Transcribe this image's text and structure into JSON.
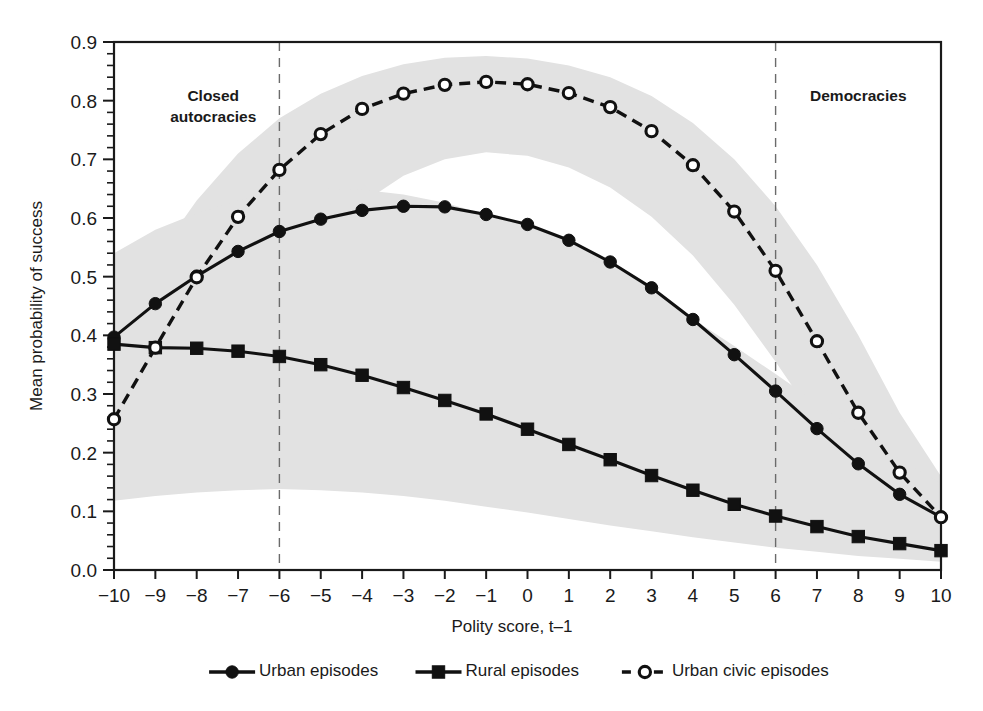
{
  "chart_data": {
    "type": "line",
    "title": "",
    "xlabel": "Polity score, t–1",
    "ylabel": "Mean probability of success",
    "xlim": [
      -10,
      10
    ],
    "ylim": [
      0.0,
      0.9
    ],
    "grid": false,
    "legend_position": "bottom",
    "x": [
      -10,
      -9,
      -8,
      -7,
      -6,
      -5,
      -4,
      -3,
      -2,
      -1,
      0,
      1,
      2,
      3,
      4,
      5,
      6,
      7,
      8,
      9,
      10
    ],
    "x_tick_labels": [
      "−10",
      "−9",
      "−8",
      "−7",
      "−6",
      "−5",
      "−4",
      "−3",
      "−2",
      "−1",
      "0",
      "1",
      "2",
      "3",
      "4",
      "5",
      "6",
      "7",
      "8",
      "9",
      "10"
    ],
    "y_tick_labels": [
      "0.0",
      "0.1",
      "0.2",
      "0.3",
      "0.4",
      "0.5",
      "0.6",
      "0.7",
      "0.8",
      "0.9"
    ],
    "y_tick_values": [
      0.0,
      0.1,
      0.2,
      0.3,
      0.4,
      0.5,
      0.6,
      0.7,
      0.8,
      0.9
    ],
    "y_minor_tick_step": 0.02,
    "series": [
      {
        "name": "Urban episodes",
        "marker": "filled-circle",
        "line_style": "solid",
        "color": "#111111",
        "values": [
          0.397,
          0.454,
          0.501,
          0.543,
          0.577,
          0.598,
          0.613,
          0.62,
          0.619,
          0.606,
          0.589,
          0.562,
          0.525,
          0.481,
          0.427,
          0.367,
          0.305,
          0.241,
          0.181,
          0.129,
          0.09
        ]
      },
      {
        "name": "Rural episodes",
        "marker": "filled-square",
        "line_style": "solid",
        "color": "#111111",
        "values": [
          0.385,
          0.379,
          0.378,
          0.373,
          0.364,
          0.35,
          0.332,
          0.311,
          0.289,
          0.266,
          0.24,
          0.214,
          0.188,
          0.161,
          0.136,
          0.112,
          0.092,
          0.074,
          0.057,
          0.045,
          0.033
        ]
      },
      {
        "name": "Urban civic episodes",
        "marker": "open-circle",
        "line_style": "dashed",
        "color": "#111111",
        "values": [
          0.257,
          0.379,
          0.499,
          0.602,
          0.682,
          0.743,
          0.786,
          0.812,
          0.827,
          0.832,
          0.828,
          0.813,
          0.789,
          0.748,
          0.69,
          0.611,
          0.51,
          0.39,
          0.268,
          0.166,
          0.09
        ]
      }
    ],
    "confidence_bands": [
      {
        "for_series": "Urban civic episodes",
        "color": "#e2e2e2",
        "lower": [
          0.12,
          0.19,
          0.28,
          0.38,
          0.48,
          0.56,
          0.625,
          0.672,
          0.7,
          0.712,
          0.706,
          0.686,
          0.652,
          0.602,
          0.536,
          0.452,
          0.355,
          0.252,
          0.158,
          0.086,
          0.036
        ],
        "upper": [
          0.42,
          0.53,
          0.63,
          0.71,
          0.77,
          0.812,
          0.842,
          0.862,
          0.873,
          0.876,
          0.872,
          0.86,
          0.84,
          0.808,
          0.762,
          0.7,
          0.62,
          0.52,
          0.4,
          0.268,
          0.16
        ]
      },
      {
        "for_series": "Urban episodes",
        "color": "#e2e2e2",
        "lower": [
          0.25,
          0.31,
          0.36,
          0.404,
          0.44,
          0.466,
          0.486,
          0.497,
          0.5,
          0.492,
          0.477,
          0.452,
          0.418,
          0.376,
          0.326,
          0.272,
          0.217,
          0.163,
          0.114,
          0.074,
          0.044
        ]
      },
      {
        "for_series": "Rural episodes",
        "color": "#e2e2e2",
        "upper": [
          0.54,
          0.58,
          0.608,
          0.63,
          0.644,
          0.65,
          0.648,
          0.64,
          0.626,
          0.606,
          0.58,
          0.548,
          0.512,
          0.472,
          0.428,
          0.382,
          0.334,
          0.285,
          0.236,
          0.19,
          0.148
        ],
        "lower": [
          0.118,
          0.126,
          0.132,
          0.136,
          0.138,
          0.136,
          0.132,
          0.126,
          0.118,
          0.108,
          0.098,
          0.087,
          0.076,
          0.066,
          0.056,
          0.047,
          0.038,
          0.031,
          0.024,
          0.019,
          0.014
        ]
      }
    ],
    "annotations": [
      {
        "text": "Closed autocracies",
        "line1": "Closed",
        "line2": "autocracies",
        "x": -7.6,
        "y": 0.8
      },
      {
        "text": "Democracies",
        "line1": "Democracies",
        "line2": "",
        "x": 8.0,
        "y": 0.8
      }
    ],
    "reference_lines": [
      {
        "at_x": -6,
        "style": "dashed"
      },
      {
        "at_x": 6,
        "style": "dashed"
      }
    ]
  }
}
